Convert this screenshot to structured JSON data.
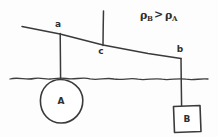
{
  "figure": {
    "background_color": "#fdfdfd",
    "ink_color": "#3a3a3a"
  },
  "annotation": {
    "rho_symbol": "ρ",
    "subscript_b": "B",
    "relation": ">",
    "subscript_a": "A",
    "full_text": "ρB > ρA"
  },
  "pivot_labels": {
    "left": "a",
    "center": "c",
    "right": "b"
  },
  "objects": {
    "sphere": {
      "label": "A",
      "shape": "circle",
      "state": "submerged-in-water"
    },
    "block": {
      "label": "B",
      "shape": "square",
      "state": "hanging-in-air"
    }
  },
  "water": {
    "name": "water-surface",
    "style": "wavy-line"
  },
  "geometry": {
    "beam_left_x": 22,
    "beam_left_y": 26,
    "beam_right_x": 181,
    "beam_right_y": 58,
    "support_x": 103,
    "support_top_y": 11,
    "hanger_a_x": 60,
    "hanger_b_x": 181,
    "water_y": 78
  }
}
